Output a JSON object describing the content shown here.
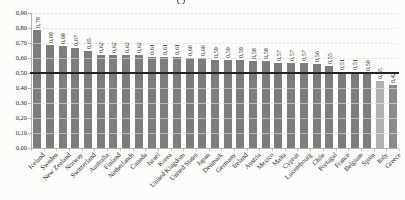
{
  "figure": {
    "background": "#fcfcfb"
  },
  "chart_data": {
    "type": "bar",
    "title": "",
    "xlabel": "",
    "ylabel": "",
    "categories": [
      "Iceland",
      "Sweden",
      "New Zealand",
      "Norway",
      "Switzerland",
      "Australia",
      "Finland",
      "Netherlands",
      "Canada",
      "Israel",
      "Korea",
      "United Kingdom",
      "United States",
      "Japan",
      "Denmark",
      "Germany",
      "Ireland",
      "Austria",
      "Mexico",
      "Malta",
      "Cyprus",
      "Luxembourg",
      "Chile",
      "Portugal",
      "France",
      "Belgium",
      "Spain",
      "Italy",
      "Greece"
    ],
    "values": [
      0.79,
      0.69,
      0.68,
      0.67,
      0.65,
      0.62,
      0.62,
      0.62,
      0.62,
      0.61,
      0.61,
      0.61,
      0.6,
      0.6,
      0.59,
      0.59,
      0.59,
      0.58,
      0.58,
      0.57,
      0.57,
      0.57,
      0.56,
      0.55,
      0.51,
      0.51,
      0.5,
      0.45,
      0.42
    ],
    "value_labels": [
      "0,79",
      "0,69",
      "0,68",
      "0,67",
      "0,65",
      "0,62",
      "0,62",
      "0,62",
      "0,62",
      "0,61",
      "0,61",
      "0,61",
      "0,60",
      "0,60",
      "0,59",
      "0,59",
      "0,59",
      "0,58",
      "0,58",
      "0,57",
      "0,57",
      "0,57",
      "0,56",
      "0,55",
      "0,51",
      "0,51",
      "0,50",
      "0,45",
      "0,42"
    ],
    "y_ticks": [
      0,
      0.1,
      0.2,
      0.3,
      0.4,
      0.5,
      0.6,
      0.7,
      0.8,
      0.9
    ],
    "y_tick_labels": [
      "0,00",
      "0,10",
      "0,20",
      "0,30",
      "0,40",
      "0,50",
      "0,60",
      "0,70",
      "0,80",
      "0,90"
    ],
    "ylim": [
      0,
      0.9
    ],
    "reference_line": 0.5,
    "grid": "horizontal-dashed",
    "legend": null,
    "number_format": "comma-decimal",
    "colors": {
      "bar_default": "#7d7d7d",
      "bar_overrides": {
        "Italy": "#b1b1b1",
        "Greece": "#8a8a8a"
      },
      "reference_line": "#222222",
      "gridline": "#c9c9c9",
      "axis": "#b3b3b3",
      "text": "#1f1f1f"
    }
  }
}
